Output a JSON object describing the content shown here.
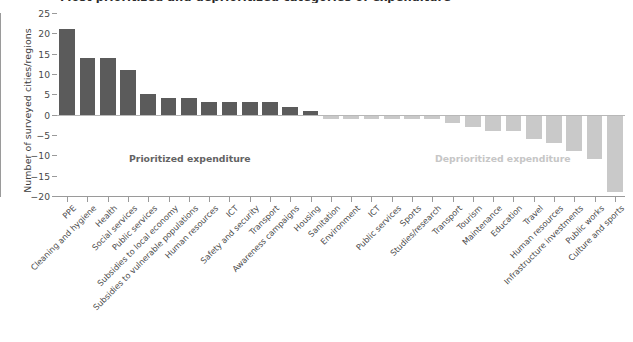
{
  "chart": {
    "title": "Most prioritized and deprioritized categories of expenditure",
    "ylabel": "Number of surveyed cities/regions",
    "xlabel": "",
    "annotations": {
      "prioritized": "Prioritized expenditure",
      "deprioritized": "Deprioritized expenditure"
    },
    "colors": {
      "positive_bar": "#5b5b5b",
      "negative_bar": "#c9c9c9",
      "axis": "#9a9a9a",
      "text": "#4a4a4a",
      "background": "#ffffff"
    }
  },
  "chart_data": {
    "type": "bar",
    "title": "Most prioritized and deprioritized categories of expenditure",
    "xlabel": "",
    "ylabel": "Number of surveyed cities/regions",
    "ylim": [
      -20,
      25
    ],
    "yticks": [
      25,
      20,
      15,
      10,
      5,
      0,
      -5,
      -10,
      -15,
      -20
    ],
    "grid": false,
    "legend": "none",
    "orientation": "vertical",
    "categories": [
      "PPE",
      "Cleaning and hygiene",
      "Health",
      "Social services",
      "Public services",
      "Subsidies to local economy",
      "Subsidies to vulnerable populations",
      "Human resources",
      "ICT",
      "Safety and security",
      "Transport",
      "Awareness campaigns",
      "Housing",
      "Sanitation",
      "Environment",
      "ICT",
      "Public services",
      "Sports",
      "Studies/research",
      "Transport",
      "Tourism",
      "Maintenance",
      "Education",
      "Travel",
      "Human resources",
      "Infrastructure investments",
      "Public works",
      "Culture and sports"
    ],
    "values": [
      21,
      14,
      14,
      11,
      5,
      4,
      4,
      3,
      3,
      3,
      3,
      2,
      1,
      -1,
      -1,
      -1,
      -1,
      -1,
      -1,
      -2,
      -3,
      -4,
      -4,
      -6,
      -7,
      -9,
      -11,
      -19
    ],
    "series": [
      {
        "name": "Number of surveyed cities/regions",
        "values": [
          21,
          14,
          14,
          11,
          5,
          4,
          4,
          3,
          3,
          3,
          3,
          2,
          1,
          -1,
          -1,
          -1,
          -1,
          -1,
          -1,
          -2,
          -3,
          -4,
          -4,
          -6,
          -7,
          -9,
          -11,
          -19
        ]
      }
    ],
    "annotations": [
      {
        "text": "Prioritized expenditure",
        "value_region": "positive"
      },
      {
        "text": "Deprioritized expenditure",
        "value_region": "negative"
      }
    ]
  }
}
